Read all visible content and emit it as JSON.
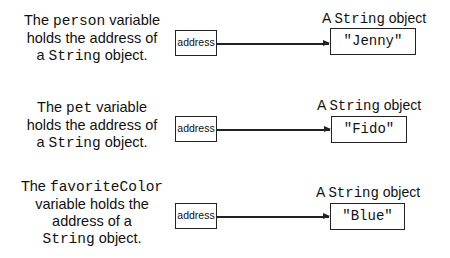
{
  "rows": [
    {
      "desc": {
        "pre": "The ",
        "var": "person",
        "post1": " variable",
        "line2": "holds the address of",
        "line3_pre": "a ",
        "line3_type": "String",
        "line3_post": " object."
      },
      "address_label": "address",
      "object_label_pre": "A ",
      "object_label_type": "String",
      "object_label_post": " object",
      "object_value": "\"Jenny\""
    },
    {
      "desc": {
        "pre": "The ",
        "var": "pet",
        "post1": " variable",
        "line2": "holds the address of",
        "line3_pre": "a ",
        "line3_type": "String",
        "line3_post": " object."
      },
      "address_label": "address",
      "object_label_pre": "A ",
      "object_label_type": "String",
      "object_label_post": " object",
      "object_value": "\"Fido\""
    },
    {
      "desc": {
        "pre": "The ",
        "var": "favoriteColor",
        "line2": "variable holds the",
        "line3": "address of a",
        "line4_type": "String",
        "line4_post": " object."
      },
      "address_label": "address",
      "object_label_pre": "A ",
      "object_label_type": "String",
      "object_label_post": " object",
      "object_value": "\"Blue\""
    }
  ]
}
